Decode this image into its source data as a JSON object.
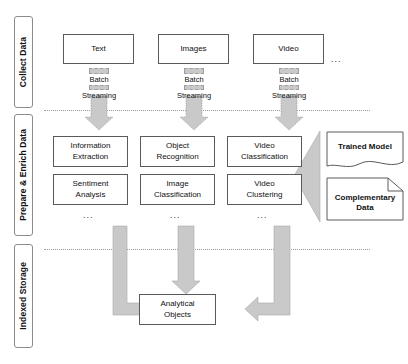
{
  "diagram": {
    "stages": [
      {
        "id": "collect",
        "label": "Collect Data"
      },
      {
        "id": "prepare",
        "label": "Prepare & Enrich Data"
      },
      {
        "id": "storage",
        "label": "Indexed Storage"
      }
    ],
    "sources": [
      {
        "id": "text",
        "label": "Text"
      },
      {
        "id": "images",
        "label": "Images"
      },
      {
        "id": "video",
        "label": "Video"
      }
    ],
    "sources_more": "...",
    "ingest_modes": [
      {
        "id": "batch",
        "label": "Batch"
      },
      {
        "id": "streaming",
        "label": "Streaming"
      }
    ],
    "processors": [
      {
        "id": "information-extraction",
        "label": "Information\nExtraction"
      },
      {
        "id": "object-recognition",
        "label": "Object\nRecognition"
      },
      {
        "id": "video-classification",
        "label": "Video\nClassification"
      },
      {
        "id": "sentiment-analysis",
        "label": "Sentiment\nAnalysis"
      },
      {
        "id": "image-classification",
        "label": "Image\nClassification"
      },
      {
        "id": "video-clustering",
        "label": "Video\nClustering"
      }
    ],
    "processors_more": [
      "...",
      "...",
      "..."
    ],
    "assets": [
      {
        "id": "trained-model",
        "label": "Trained Model"
      },
      {
        "id": "complementary-data",
        "label": "Complementary\nData"
      }
    ],
    "output": {
      "id": "analytical-objects",
      "label": "Analytical\nObjects"
    },
    "colors": {
      "arrow_fill": "#c9c9c9",
      "arrow_stroke": "#9e9e9e",
      "box_stroke": "#5a5a5a",
      "bracket_stroke": "#8c8c8c",
      "divider": "#9a9a9a",
      "text": "#111111",
      "background": "#ffffff"
    }
  }
}
